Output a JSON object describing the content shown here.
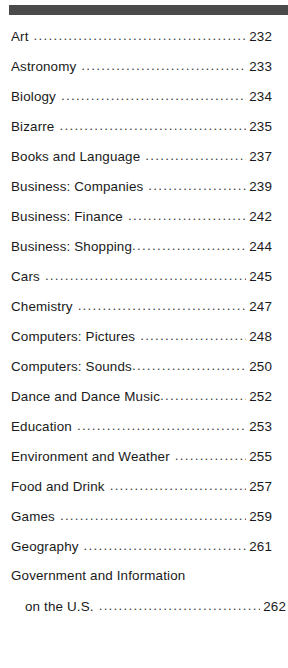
{
  "page": {
    "type": "table-of-contents",
    "background_color": "#ffffff",
    "text_color": "#1a1a1a",
    "rule_color": "#4a4a4a"
  },
  "header_rule": {
    "name": "decorative-rule"
  },
  "toc": {
    "entries": [
      {
        "label": "Art",
        "gap_before_leader": true,
        "page": "232"
      },
      {
        "label": "Astronomy",
        "gap_before_leader": true,
        "page": "233"
      },
      {
        "label": "Biology",
        "gap_before_leader": true,
        "page": "234"
      },
      {
        "label": "Bizarre",
        "gap_before_leader": true,
        "page": "235"
      },
      {
        "label": "Books and Language",
        "gap_before_leader": true,
        "page": "237"
      },
      {
        "label": "Business: Companies",
        "gap_before_leader": true,
        "page": "239"
      },
      {
        "label": "Business: Finance",
        "gap_before_leader": true,
        "page": "242"
      },
      {
        "label": "Business: Shopping",
        "gap_before_leader": false,
        "page": "244"
      },
      {
        "label": "Cars",
        "gap_before_leader": true,
        "page": "245"
      },
      {
        "label": "Chemistry",
        "gap_before_leader": true,
        "page": "247"
      },
      {
        "label": "Computers: Pictures",
        "gap_before_leader": true,
        "page": "248"
      },
      {
        "label": "Computers: Sounds",
        "gap_before_leader": false,
        "page": "250"
      },
      {
        "label": "Dance and Dance Music",
        "gap_before_leader": false,
        "page": "252"
      },
      {
        "label": "Education",
        "gap_before_leader": true,
        "page": "253"
      },
      {
        "label": "Environment and Weather",
        "gap_before_leader": true,
        "page": "255"
      },
      {
        "label": "Food and Drink",
        "gap_before_leader": true,
        "page": "257"
      },
      {
        "label": "Games",
        "gap_before_leader": true,
        "page": "259"
      },
      {
        "label": "Geography",
        "gap_before_leader": true,
        "page": "261"
      },
      {
        "label": "Government and Information",
        "label_line2": "on the U.S.",
        "gap_before_leader": true,
        "page": "262",
        "two_line": true
      }
    ]
  }
}
